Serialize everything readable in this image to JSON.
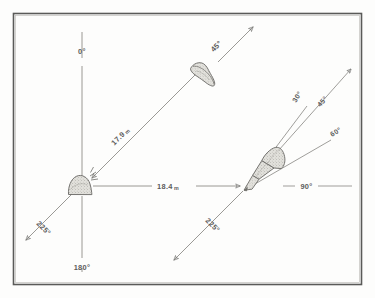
{
  "figure": {
    "type": "technical-bearing-diagram",
    "frame": {
      "border_color": "#5a5a58",
      "background": "#fdfdfc"
    },
    "ink_color": "#6a6a68",
    "stipple_color": "#cfcfca",
    "left_vertex": {
      "name": "left-station",
      "object": "dome-shape",
      "bearings": [
        {
          "id": "b-0",
          "label": "0°",
          "direction": "up"
        },
        {
          "id": "b-180",
          "label": "180°",
          "direction": "down"
        },
        {
          "id": "b-225",
          "label": "225°",
          "direction": "down-left"
        },
        {
          "id": "b-45-left",
          "label": "45°",
          "direction": "up-right"
        }
      ]
    },
    "right_vertex": {
      "name": "right-station",
      "object": "cone-shape",
      "bearings": [
        {
          "id": "r-30",
          "label": "30°"
        },
        {
          "id": "r-45",
          "label": "45°"
        },
        {
          "id": "r-60",
          "label": "60°"
        },
        {
          "id": "r-90",
          "label": "90°"
        },
        {
          "id": "r-225",
          "label": "225°"
        }
      ]
    },
    "distances": [
      {
        "id": "d-diagonal",
        "value": "17.9",
        "unit": "m",
        "label": "17.9 m"
      },
      {
        "id": "d-horizontal",
        "value": "18.4",
        "unit": "m",
        "label": "18.4 m"
      }
    ],
    "objects": [
      {
        "id": "obj-dome",
        "name": "dome-specimen"
      },
      {
        "id": "obj-teardrop",
        "name": "teardrop-specimen"
      },
      {
        "id": "obj-cone",
        "name": "cone-specimen"
      }
    ]
  },
  "labels": {
    "zero": "0°",
    "one_eighty": "180°",
    "two_twenty_five_left": "225°",
    "forty_five_upper": "45°",
    "thirty": "30°",
    "forty_five_right": "45°",
    "sixty": "60°",
    "ninety": "90°",
    "two_twenty_five_right": "225°",
    "dist_diagonal_num": "17.9",
    "dist_diagonal_unit": "m",
    "dist_horizontal_num": "18.4",
    "dist_horizontal_unit": "m"
  }
}
